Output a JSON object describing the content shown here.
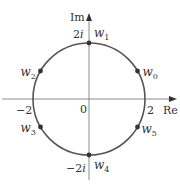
{
  "diagram": {
    "title": "",
    "colors": {
      "axis": "#888888",
      "circle": "#555555",
      "point": "#333333",
      "text": "#333333"
    },
    "axes": {
      "x_label": "Re",
      "y_label": "Im",
      "origin_label": "0",
      "x_ticks": [
        {
          "label": "−2",
          "value": -2
        },
        {
          "label": "2",
          "value": 2
        }
      ],
      "y_ticks": [
        {
          "label": "2i",
          "value": 2
        },
        {
          "label": "−2i",
          "value": -2
        }
      ]
    },
    "circle": {
      "center": [
        0,
        0
      ],
      "radius": 2
    },
    "points": [
      {
        "name": "w",
        "sub": "0",
        "angle_deg": 30
      },
      {
        "name": "w",
        "sub": "1",
        "angle_deg": 90
      },
      {
        "name": "w",
        "sub": "2",
        "angle_deg": 150
      },
      {
        "name": "w",
        "sub": "3",
        "angle_deg": 210
      },
      {
        "name": "w",
        "sub": "4",
        "angle_deg": 270
      },
      {
        "name": "w",
        "sub": "5",
        "angle_deg": 330
      }
    ]
  }
}
